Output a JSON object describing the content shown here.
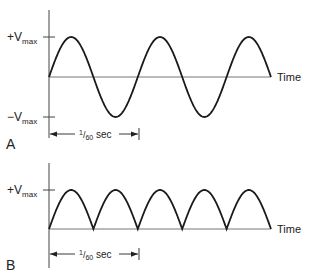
{
  "panels": [
    {
      "id": "A",
      "label": "A",
      "title": "AC sine wave",
      "y_pos_label": {
        "prefix": "+V",
        "sub": "max"
      },
      "y_neg_label": {
        "prefix": "−V",
        "sub": "max"
      },
      "x_label": "Time",
      "period_label": {
        "num": "1",
        "den": "60",
        "unit": " sec"
      },
      "cycles": 2.5
    },
    {
      "id": "B",
      "label": "B",
      "title": "Full-wave rectified",
      "y_pos_label": {
        "prefix": "+V",
        "sub": "max"
      },
      "x_label": "Time",
      "period_label": {
        "num": "1",
        "den": "60",
        "unit": " sec"
      },
      "half_cycles": 5
    }
  ],
  "colors": {
    "stroke": "#1a1a1a",
    "axis": "#555555",
    "background": "#ffffff"
  }
}
